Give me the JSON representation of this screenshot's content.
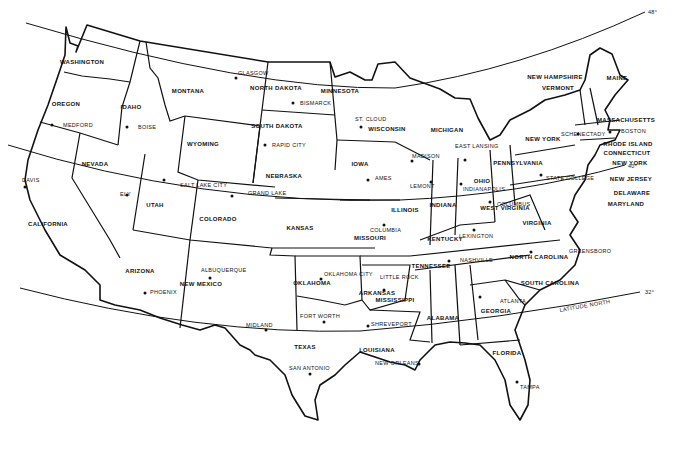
{
  "map": {
    "title": "United States Map",
    "latitudes": [
      {
        "label": "48°",
        "x": 648,
        "y": 12
      },
      {
        "label": "40°",
        "x": 628,
        "y": 165
      },
      {
        "label": "32°",
        "x": 645,
        "y": 292
      },
      {
        "label": "LATITUDE NORTH",
        "x": 560,
        "y": 308
      }
    ],
    "states": [
      {
        "name": "WASHINGTON",
        "x": 82,
        "y": 64
      },
      {
        "name": "OREGON",
        "x": 66,
        "y": 106
      },
      {
        "name": "IDAHO",
        "x": 131,
        "y": 109
      },
      {
        "name": "MONTANA",
        "x": 188,
        "y": 93
      },
      {
        "name": "WYOMING",
        "x": 203,
        "y": 146
      },
      {
        "name": "NORTH DAKOTA",
        "x": 276,
        "y": 90
      },
      {
        "name": "SOUTH DAKOTA",
        "x": 277,
        "y": 128
      },
      {
        "name": "MINNESOTA",
        "x": 340,
        "y": 93
      },
      {
        "name": "NEVADA",
        "x": 95,
        "y": 166
      },
      {
        "name": "UTAH",
        "x": 155,
        "y": 207
      },
      {
        "name": "COLORADO",
        "x": 218,
        "y": 221
      },
      {
        "name": "NEBRASKA",
        "x": 284,
        "y": 178
      },
      {
        "name": "KANSAS",
        "x": 300,
        "y": 230
      },
      {
        "name": "IOWA",
        "x": 360,
        "y": 166
      },
      {
        "name": "WISCONSIN",
        "x": 387,
        "y": 131
      },
      {
        "name": "MICHIGAN",
        "x": 447,
        "y": 132
      },
      {
        "name": "ILLINOIS",
        "x": 405,
        "y": 212
      },
      {
        "name": "INDIANA",
        "x": 443,
        "y": 207
      },
      {
        "name": "OHIO",
        "x": 482,
        "y": 183
      },
      {
        "name": "PENNSYLVANIA",
        "x": 518,
        "y": 165
      },
      {
        "name": "NEW YORK",
        "x": 543,
        "y": 141
      },
      {
        "name": "CALIFORNIA",
        "x": 48,
        "y": 226
      },
      {
        "name": "ARIZONA",
        "x": 140,
        "y": 273
      },
      {
        "name": "NEW MEXICO",
        "x": 201,
        "y": 286
      },
      {
        "name": "OKLAHOMA",
        "x": 312,
        "y": 285
      },
      {
        "name": "TEXAS",
        "x": 305,
        "y": 349
      },
      {
        "name": "MISSOURI",
        "x": 370,
        "y": 240
      },
      {
        "name": "ARKANSAS",
        "x": 377,
        "y": 295
      },
      {
        "name": "LOUISIANA",
        "x": 377,
        "y": 352
      },
      {
        "name": "MISSISSIPPI",
        "x": 395,
        "y": 302
      },
      {
        "name": "ALABAMA",
        "x": 443,
        "y": 320
      },
      {
        "name": "GEORGIA",
        "x": 496,
        "y": 313
      },
      {
        "name": "FLORIDA",
        "x": 507,
        "y": 355
      },
      {
        "name": "TENNESSEE",
        "x": 431,
        "y": 268
      },
      {
        "name": "KENTUCKY",
        "x": 445,
        "y": 241
      },
      {
        "name": "WEST VIRGINIA",
        "x": 505,
        "y": 210
      },
      {
        "name": "VIRGINIA",
        "x": 537,
        "y": 225
      },
      {
        "name": "NORTH CAROLINA",
        "x": 539,
        "y": 259
      },
      {
        "name": "SOUTH CAROLINA",
        "x": 550,
        "y": 285
      },
      {
        "name": "MAINE",
        "x": 617,
        "y": 80
      },
      {
        "name": "NEW HAMPSHIRE",
        "x": 555,
        "y": 79
      },
      {
        "name": "VERMONT",
        "x": 558,
        "y": 90
      },
      {
        "name": "MASSACHUSETTS",
        "x": 626,
        "y": 122
      },
      {
        "name": "RHODE ISLAND",
        "x": 628,
        "y": 146
      },
      {
        "name": "CONNECTICUT",
        "x": 627,
        "y": 155
      },
      {
        "name": "NEW YORK",
        "x": 630,
        "y": 165
      },
      {
        "name": "NEW JERSEY",
        "x": 631,
        "y": 181
      },
      {
        "name": "DELAWARE",
        "x": 632,
        "y": 195
      },
      {
        "name": "MARYLAND",
        "x": 626,
        "y": 206
      }
    ],
    "cities": [
      {
        "name": "GLASGOW",
        "x": 238,
        "y": 75,
        "dx": 236,
        "dy": 78
      },
      {
        "name": "BISMARCK",
        "x": 300,
        "y": 105,
        "dx": 293,
        "dy": 103
      },
      {
        "name": "MEDFORD",
        "x": 63,
        "y": 127,
        "dx": 52,
        "dy": 125
      },
      {
        "name": "BOISE",
        "x": 138,
        "y": 129,
        "dx": 127,
        "dy": 127
      },
      {
        "name": "RAPID CITY",
        "x": 272,
        "y": 147,
        "dx": 265,
        "dy": 145
      },
      {
        "name": "ST. CLOUD",
        "x": 355,
        "y": 121,
        "dx": 361,
        "dy": 127
      },
      {
        "name": "MADISON",
        "x": 412,
        "y": 158,
        "dx": 412,
        "dy": 161
      },
      {
        "name": "EAST LANSING",
        "x": 455,
        "y": 148,
        "dx": 465,
        "dy": 160
      },
      {
        "name": "SCHENECTADY",
        "x": 561,
        "y": 136,
        "dx": 578,
        "dy": 134
      },
      {
        "name": "BOSTON",
        "x": 621,
        "y": 133,
        "dx": 610,
        "dy": 132
      },
      {
        "name": "DAVIS",
        "x": 22,
        "y": 182,
        "dx": 25,
        "dy": 187
      },
      {
        "name": "ELY",
        "x": 120,
        "y": 196,
        "dx": 127,
        "dy": 195
      },
      {
        "name": "SALT LAKE CITY",
        "x": 180,
        "y": 187,
        "dx": 164,
        "dy": 180
      },
      {
        "name": "GRAND LAKE",
        "x": 248,
        "y": 195,
        "dx": 232,
        "dy": 196
      },
      {
        "name": "AMES",
        "x": 375,
        "y": 180,
        "dx": 368,
        "dy": 180
      },
      {
        "name": "LEMONT",
        "x": 410,
        "y": 188,
        "dx": 431,
        "dy": 182
      },
      {
        "name": "INDIANAPOLIS",
        "x": 463,
        "y": 191,
        "dx": 461,
        "dy": 184
      },
      {
        "name": "STATE COLLEGE",
        "x": 546,
        "y": 180,
        "dx": 541,
        "dy": 175
      },
      {
        "name": "COLUMBUS",
        "x": 497,
        "y": 206,
        "dx": 490,
        "dy": 202
      },
      {
        "name": "COLUMBIA",
        "x": 370,
        "y": 232,
        "dx": 384,
        "dy": 225
      },
      {
        "name": "LEXINGTON",
        "x": 459,
        "y": 238,
        "dx": 474,
        "dy": 230
      },
      {
        "name": "GREENSBORO",
        "x": 569,
        "y": 253,
        "dx": 531,
        "dy": 252
      },
      {
        "name": "NASHVILLE",
        "x": 460,
        "y": 262,
        "dx": 449,
        "dy": 261
      },
      {
        "name": "ALBUQUERQUE",
        "x": 201,
        "y": 272,
        "dx": 210,
        "dy": 278
      },
      {
        "name": "OKLAHOMA CITY",
        "x": 324,
        "y": 276,
        "dx": 321,
        "dy": 279
      },
      {
        "name": "PHOENIX",
        "x": 150,
        "y": 294,
        "dx": 145,
        "dy": 293
      },
      {
        "name": "LITTLE ROCK",
        "x": 380,
        "y": 279,
        "dx": 384,
        "dy": 290
      },
      {
        "name": "ATLANTA",
        "x": 500,
        "y": 303,
        "dx": 480,
        "dy": 297
      },
      {
        "name": "MIDLAND",
        "x": 246,
        "y": 327,
        "dx": 266,
        "dy": 330
      },
      {
        "name": "FORT WORTH",
        "x": 300,
        "y": 318,
        "dx": 324,
        "dy": 322
      },
      {
        "name": "SHREVEPORT",
        "x": 371,
        "y": 326,
        "dx": 368,
        "dy": 326
      },
      {
        "name": "SAN ANTONIO",
        "x": 289,
        "y": 370,
        "dx": 310,
        "dy": 374
      },
      {
        "name": "NEW ORLEANS",
        "x": 375,
        "y": 365,
        "dx": 419,
        "dy": 364
      },
      {
        "name": "TAMPA",
        "x": 520,
        "y": 389,
        "dx": 517,
        "dy": 382
      }
    ]
  }
}
